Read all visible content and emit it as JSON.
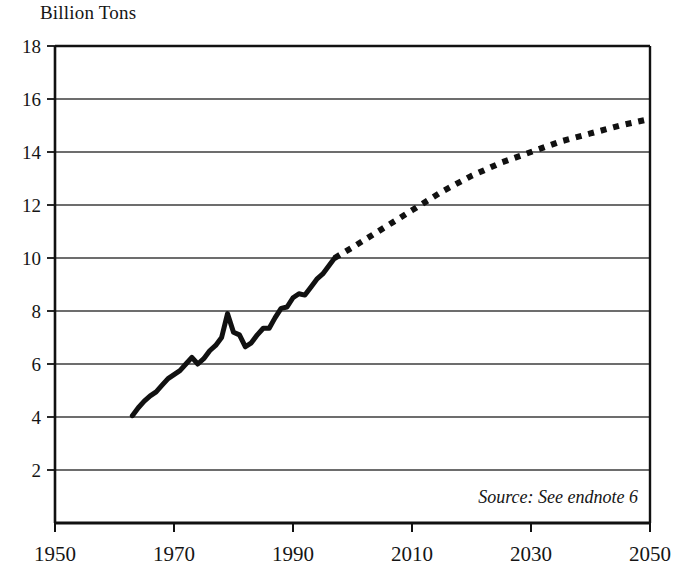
{
  "figure": {
    "title": "Billion Tons",
    "source_note": "Source: See endnote 6",
    "ink_color": "#111111",
    "grid_color": "#3c3c3c",
    "background": "#ffffff"
  },
  "axes": {
    "y_ticks": [
      18,
      16,
      14,
      12,
      10,
      8,
      6,
      4,
      2
    ],
    "y_tick_labels": [
      "18",
      "16",
      "14",
      "12",
      "10",
      "8",
      "6",
      "4",
      "2"
    ],
    "x_ticks": [
      1950,
      1970,
      1990,
      2010,
      2030,
      2050
    ],
    "x_tick_labels": [
      "1950",
      "1970",
      "1990",
      "2010",
      "2030",
      "2050"
    ]
  },
  "chart_data": {
    "type": "line",
    "title": "Billion Tons",
    "xlabel": "",
    "ylabel": "Billion Tons",
    "xlim": [
      1950,
      2050
    ],
    "ylim": [
      0,
      18
    ],
    "grid": "horizontal",
    "legend": "none",
    "annotations": [
      "Source: See endnote 6"
    ],
    "series": [
      {
        "name": "Historical",
        "style": "solid",
        "linewidth": 5,
        "color": "#111111",
        "x": [
          1963,
          1964,
          1965,
          1966,
          1967,
          1968,
          1969,
          1970,
          1971,
          1972,
          1973,
          1974,
          1975,
          1976,
          1977,
          1978,
          1979,
          1980,
          1981,
          1982,
          1983,
          1984,
          1985,
          1986,
          1987,
          1988,
          1989,
          1990,
          1991,
          1992,
          1993,
          1994,
          1995,
          1996,
          1997
        ],
        "values": [
          4.05,
          4.35,
          4.6,
          4.8,
          4.95,
          5.2,
          5.45,
          5.6,
          5.75,
          6.0,
          6.25,
          6.0,
          6.2,
          6.5,
          6.7,
          7.0,
          7.9,
          7.2,
          7.1,
          6.65,
          6.8,
          7.1,
          7.35,
          7.35,
          7.75,
          8.1,
          8.15,
          8.5,
          8.65,
          8.6,
          8.9,
          9.2,
          9.4,
          9.7,
          10.0
        ]
      },
      {
        "name": "Projection",
        "style": "dotted",
        "linewidth": 6,
        "color": "#111111",
        "x": [
          1997,
          2000,
          2005,
          2010,
          2015,
          2020,
          2025,
          2030,
          2035,
          2040,
          2045,
          2050
        ],
        "values": [
          10.0,
          10.4,
          11.1,
          11.8,
          12.5,
          13.1,
          13.6,
          14.0,
          14.4,
          14.7,
          15.0,
          15.25
        ]
      }
    ]
  }
}
